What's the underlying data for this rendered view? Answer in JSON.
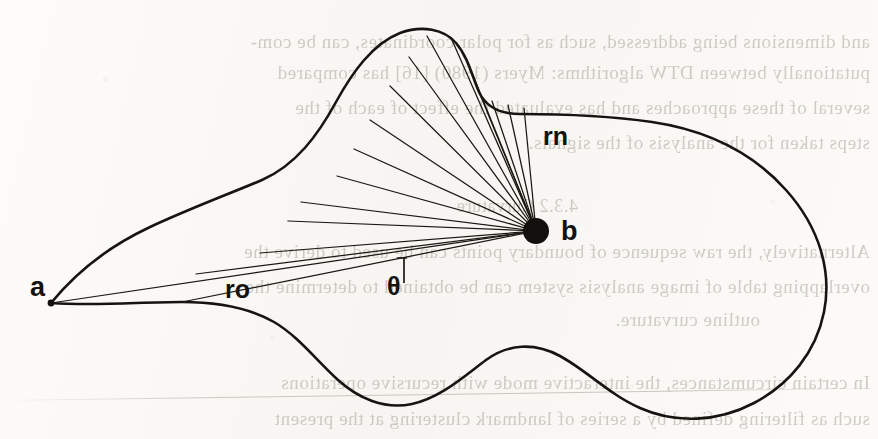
{
  "page": {
    "width": 878,
    "height": 439,
    "background_color": "#fbfaf8",
    "ink_color": "#141210"
  },
  "figure": {
    "caption": "",
    "labels": {
      "point_a": "a",
      "point_b": "b",
      "radius_first": "ro",
      "radius_last": "rn",
      "angle": "θ"
    }
  },
  "bleed_text": {
    "note": "Faint mirrored show-through text from the reverse side of the scanned page.",
    "lines": [
      {
        "text": "and dimensions being addressed, such as for polar coordinates, can be com-",
        "top": 31,
        "style": "normal"
      },
      {
        "text": "putationally between DTW algorithms: Myers (1980) [16] has compared",
        "top": 62,
        "style": "normal"
      },
      {
        "text": "several of these approaches and has evaluated the effect of each of the",
        "top": 97,
        "style": "normal"
      },
      {
        "text": "steps taken for the analysis of the signals.",
        "top": 132,
        "style": "normal"
      },
      {
        "text": "4.3.2  Curvature",
        "top": 196,
        "style": "head"
      },
      {
        "text": "Alternatively, the raw sequence of boundary points can be used to derive the",
        "top": 241,
        "style": "normal"
      },
      {
        "text": "overlapping table of image analysis system can be obtained to determine the",
        "top": 276,
        "style": "normal"
      },
      {
        "text": "outline curvature.",
        "top": 309,
        "style": "indent"
      },
      {
        "text": "In certain circumstances, the interactive mode with recursive operations",
        "top": 372,
        "style": "normal"
      },
      {
        "text": "such as filtering defined by a series of landmark clustering at the present",
        "top": 408,
        "style": "normal"
      }
    ]
  },
  "geometry": {
    "point_a": {
      "x": 51,
      "y": 303
    },
    "point_b": {
      "x": 536,
      "y": 231,
      "dot_radius": 13
    },
    "outline_path": "M 51,303 C 78,270 110,246 148,228 C 186,210 224,196 262,180 C 296,165 318,135 336,102 C 352,73 372,44 400,33 C 422,25 444,29 456,43 C 468,57 472,76 479,92 C 486,107 500,114 520,114 C 560,114 610,116 652,122 C 706,130 752,152 786,190 C 820,228 832,272 824,312 C 816,352 790,384 754,403 C 718,422 676,424 640,408 C 610,395 586,370 560,356 C 534,342 508,344 486,360 C 462,378 440,398 412,404 C 384,410 358,398 338,380 C 316,360 298,336 274,322 C 246,306 214,302 182,302 C 140,302 96,306 51,303 Z",
    "rays": [
      {
        "from": "b",
        "to_x": 51,
        "to_y": 303,
        "label": "ro"
      },
      {
        "from": "b",
        "to_x": 182,
        "to_y": 302
      },
      {
        "from": "b",
        "to_x": 196,
        "to_y": 274
      },
      {
        "from": "b",
        "to_x": 260,
        "to_y": 253
      },
      {
        "from": "b",
        "to_x": 288,
        "to_y": 221
      },
      {
        "from": "b",
        "to_x": 301,
        "to_y": 202
      },
      {
        "from": "b",
        "to_x": 337,
        "to_y": 176
      },
      {
        "from": "b",
        "to_x": 354,
        "to_y": 149
      },
      {
        "from": "b",
        "to_x": 370,
        "to_y": 120
      },
      {
        "from": "b",
        "to_x": 390,
        "to_y": 86
      },
      {
        "from": "b",
        "to_x": 409,
        "to_y": 57
      },
      {
        "from": "b",
        "to_x": 427,
        "to_y": 36
      },
      {
        "from": "b",
        "to_x": 452,
        "to_y": 40
      },
      {
        "from": "b",
        "to_x": 468,
        "to_y": 63
      },
      {
        "from": "b",
        "to_x": 479,
        "to_y": 92
      },
      {
        "from": "b",
        "to_x": 492,
        "to_y": 101
      },
      {
        "from": "b",
        "to_x": 508,
        "to_y": 105
      },
      {
        "from": "b",
        "to_x": 524,
        "to_y": 108,
        "label": "rn"
      }
    ],
    "angle_marker": {
      "vertex_x": 404,
      "top_y": 258,
      "bottom_y": 283
    }
  }
}
